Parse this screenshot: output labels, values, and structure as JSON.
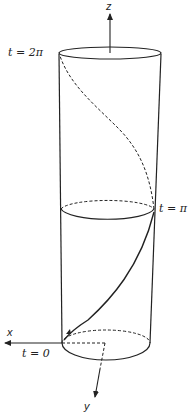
{
  "diagram": {
    "type": "helix-on-cylinder",
    "axes": {
      "x": {
        "label": "x"
      },
      "y": {
        "label": "y"
      },
      "z": {
        "label": "z"
      }
    },
    "parameter_labels": {
      "start": "t = 0",
      "middle": "t = π",
      "end": "t = 2π"
    },
    "colors": {
      "stroke": "#222222",
      "background": "#ffffff"
    },
    "line_styles": {
      "visible": "solid",
      "hidden": "dashed"
    }
  }
}
